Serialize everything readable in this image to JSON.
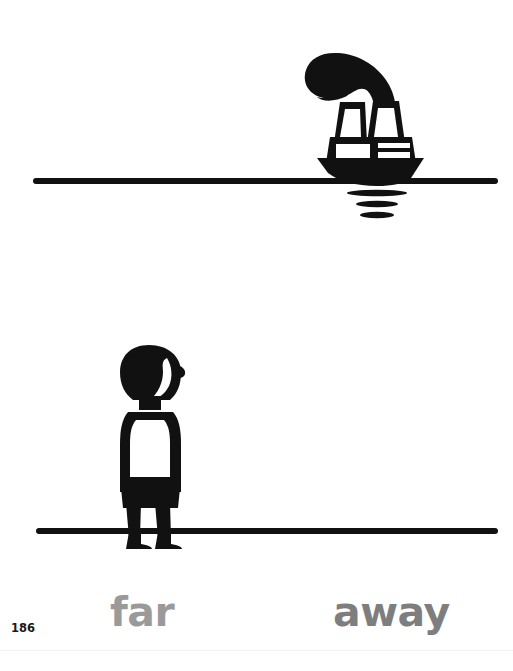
{
  "page": {
    "background_color": "#ffffff",
    "width": 513,
    "height": 671,
    "number": "186",
    "bottom_rule_color": "#f1f2f4"
  },
  "illustration": {
    "ink_color": "#111111",
    "top_scene": {
      "name": "boat-on-horizon",
      "description": "steamship with two funnels and smoke plume sitting on a horizon line with reflection ripples",
      "horizon_line": {
        "x1": 33,
        "x2": 498,
        "y": 181,
        "thickness": 6
      },
      "reflection_ripples": [
        {
          "cx": 377,
          "cy": 192,
          "width": 60,
          "height": 6
        },
        {
          "cx": 377,
          "cy": 203,
          "width": 42,
          "height": 6
        },
        {
          "cx": 377,
          "cy": 214,
          "width": 34,
          "height": 6
        }
      ]
    },
    "bottom_scene": {
      "name": "person-looking-up",
      "description": "standing child in profile facing right, looking toward the distant boat",
      "ground_line": {
        "x1": 36,
        "x2": 498,
        "y": 531,
        "thickness": 6
      }
    }
  },
  "caption": {
    "words": [
      {
        "id": "far",
        "text": "far",
        "color": "#9a9a9a"
      },
      {
        "id": "away",
        "text": "away",
        "color": "#7e7e7e"
      }
    ]
  }
}
